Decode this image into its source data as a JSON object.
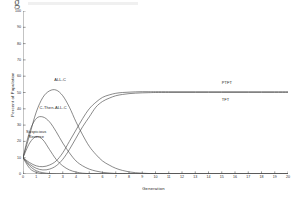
{
  "chart_data": {
    "type": "line",
    "title": "",
    "xlabel": "Generation",
    "ylabel": "Percent of Population",
    "xlim": [
      0,
      20
    ],
    "ylim": [
      0,
      100
    ],
    "grid": false,
    "legend_position": "inline-annotations",
    "x_ticks": [
      "0",
      "1",
      "2",
      "3",
      "4",
      "5",
      "6",
      "7",
      "8",
      "9",
      "10",
      "11",
      "12",
      "13",
      "14",
      "15",
      "16",
      "17",
      "18",
      "19",
      "20"
    ],
    "y_ticks": [
      "0",
      "10",
      "20",
      "30",
      "40",
      "50",
      "60",
      "70",
      "80",
      "90",
      "100"
    ],
    "x": [
      0,
      0.5,
      1,
      1.5,
      2,
      2.5,
      3,
      3.5,
      4,
      4.5,
      5,
      5.5,
      6,
      6.5,
      7,
      7.5,
      8,
      8.5,
      9,
      9.5,
      10,
      11,
      12,
      13,
      14,
      15,
      16,
      17,
      18,
      19,
      20
    ],
    "series": [
      {
        "name": "ALL-C",
        "label": "ALL-C",
        "color": "#4a4a4a",
        "values": [
          10,
          24,
          38,
          47,
          51,
          51.5,
          48,
          41,
          32,
          24,
          17,
          12,
          8,
          5.5,
          3.5,
          2.2,
          1.3,
          0.8,
          0.5,
          0.3,
          0.2,
          0.1,
          0,
          0,
          0,
          0,
          0,
          0,
          0,
          0,
          0
        ]
      },
      {
        "name": "C-Then-ALL-C",
        "label": "C-Then-ALL-C",
        "color": "#4a4a4a",
        "values": [
          10,
          26,
          34,
          35,
          32,
          26,
          19,
          13,
          8,
          5,
          3,
          1.8,
          1,
          0.6,
          0.3,
          0.2,
          0.1,
          0,
          0,
          0,
          0,
          0,
          0,
          0,
          0,
          0,
          0,
          0,
          0,
          0,
          0
        ]
      },
      {
        "name": "Suspicious Reverse",
        "label": "Suspicious Reverse",
        "color": "#4a4a4a",
        "values": [
          10,
          19,
          23,
          21,
          15,
          9,
          5,
          2.5,
          1.2,
          0.5,
          0.2,
          0.1,
          0,
          0,
          0,
          0,
          0,
          0,
          0,
          0,
          0,
          0,
          0,
          0,
          0,
          0,
          0,
          0,
          0,
          0,
          0
        ]
      },
      {
        "name": "PTFT",
        "label": "PTFT",
        "color": "#4a4a4a",
        "values": [
          10,
          7,
          5,
          4.5,
          5.5,
          8,
          13,
          20,
          27,
          34,
          40,
          44,
          47,
          48.5,
          49.5,
          50,
          50.2,
          50.4,
          50.5,
          50.5,
          50.5,
          50.5,
          50.5,
          50.5,
          50.5,
          50.5,
          50.5,
          50.5,
          50.5,
          50.5,
          50.5
        ]
      },
      {
        "name": "TFT",
        "label": "TFT",
        "color": "#4a4a4a",
        "values": [
          10,
          6,
          3.5,
          2.5,
          3,
          5,
          9,
          15,
          22,
          29,
          35,
          41,
          44.5,
          46.5,
          48,
          48.8,
          49.3,
          49.6,
          49.8,
          49.9,
          50,
          50,
          50,
          50,
          50,
          50,
          50,
          50,
          50,
          50,
          50
        ]
      },
      {
        "name": "declining-minor-1",
        "label": "",
        "color": "#4a4a4a",
        "values": [
          10,
          5,
          2,
          0.8,
          0.3,
          0.1,
          0,
          0,
          0,
          0,
          0,
          0,
          0,
          0,
          0,
          0,
          0,
          0,
          0,
          0,
          0,
          0,
          0,
          0,
          0,
          0,
          0,
          0,
          0,
          0,
          0
        ]
      },
      {
        "name": "declining-minor-2",
        "label": "",
        "color": "#4a4a4a",
        "values": [
          10,
          3.5,
          1,
          0.2,
          0,
          0,
          0,
          0,
          0,
          0,
          0,
          0,
          0,
          0,
          0,
          0,
          0,
          0,
          0,
          0,
          0,
          0,
          0,
          0,
          0,
          0,
          0,
          0,
          0,
          0,
          0
        ]
      }
    ],
    "annotations": [
      {
        "name": "ALL-C",
        "text": "ALL-C",
        "x": 2.35,
        "y": 57
      },
      {
        "name": "C-Then-ALL-C",
        "text": "C-Then-ALL-C",
        "x": 1.25,
        "y": 40
      },
      {
        "name": "Suspicious-Reverse",
        "text_line1": "Suspicious",
        "text_line2": "Reverse",
        "x": 1.0,
        "y": 25
      },
      {
        "name": "PTFT",
        "text": "PTFT",
        "x": 15.0,
        "y": 55
      },
      {
        "name": "TFT",
        "text": "TFT",
        "x": 15.0,
        "y": 45
      }
    ]
  },
  "axes": {
    "x_title": "Generation",
    "y_title": "Percent of Population"
  }
}
